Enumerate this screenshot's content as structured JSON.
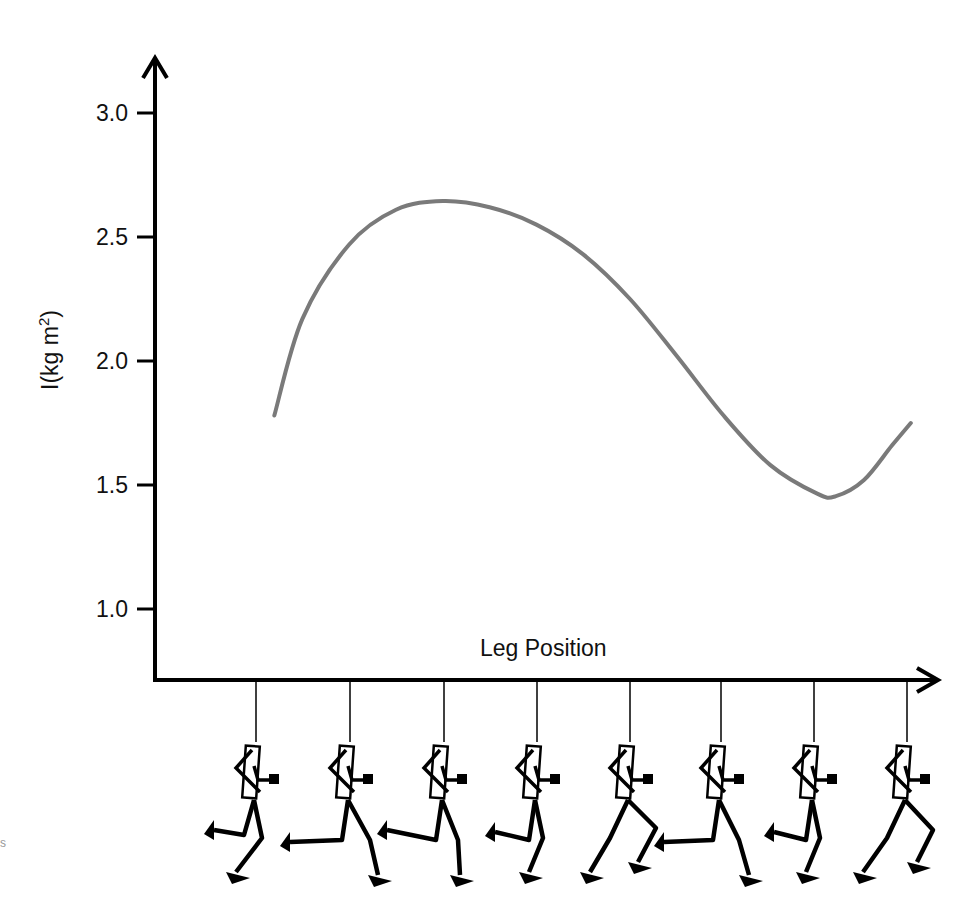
{
  "header_fragment": "",
  "side_fragment": "s",
  "chart_data": {
    "type": "line",
    "title": "",
    "xlabel": "Leg Position",
    "ylabel": "I(kg m²)",
    "ylabel_parts": {
      "base": "I(kg m",
      "sup": "2",
      "close": ")"
    },
    "yticks": [
      1.0,
      1.5,
      2.0,
      2.5,
      3.0
    ],
    "ytick_labels": [
      "1.0",
      "1.5",
      "2.0",
      "2.5",
      "3.0"
    ],
    "ylim": [
      0.72,
      3.3
    ],
    "xlim": [
      0,
      8
    ],
    "x_categories": [
      "pose-1",
      "pose-2",
      "pose-3",
      "pose-4",
      "pose-5",
      "pose-6",
      "pose-7",
      "pose-8"
    ],
    "grid": false,
    "legend": null,
    "line_color": "#7a7a7a",
    "series": [
      {
        "name": "Moment of inertia of leg",
        "x": [
          1.2,
          1.5,
          2.0,
          2.5,
          3.0,
          3.5,
          4.0,
          4.5,
          5.0,
          5.5,
          6.0,
          6.5,
          7.0,
          7.2,
          7.5,
          7.8,
          8.0
        ],
        "y": [
          1.78,
          2.17,
          2.47,
          2.61,
          2.645,
          2.62,
          2.55,
          2.43,
          2.25,
          2.02,
          1.78,
          1.58,
          1.465,
          1.455,
          1.52,
          1.66,
          1.75
        ]
      }
    ],
    "pose_tick_positions": [
      1,
      2,
      3,
      4,
      5,
      6,
      7,
      8
    ],
    "annotations": [
      "Eight stick-figure runner poses below x-axis illustrating leg positions through a running stride"
    ]
  }
}
